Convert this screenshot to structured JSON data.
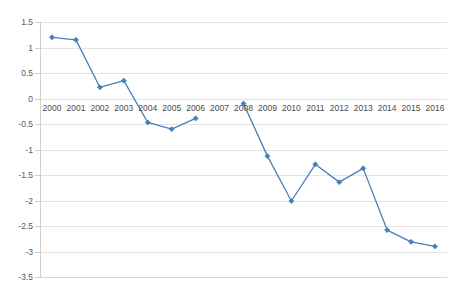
{
  "chart_data": {
    "type": "line",
    "title": "",
    "subtitle": "",
    "xlabel": "",
    "ylabel": "",
    "categories": [
      "2000",
      "2001",
      "2002",
      "2003",
      "2004",
      "2005",
      "2006",
      "2007",
      "2008",
      "2009",
      "2010",
      "2011",
      "2012",
      "2013",
      "2014",
      "2015",
      "2016"
    ],
    "series": [
      {
        "name": "Series 1",
        "color": "#4a7ebb",
        "values": [
          1.2,
          1.15,
          0.22,
          0.35,
          -0.47,
          -0.6,
          -0.39,
          null,
          -0.1,
          -1.13,
          -2.01,
          -1.29,
          -1.64,
          -1.37,
          -2.58,
          -2.81,
          -2.9
        ]
      }
    ],
    "ylim": [
      -3.5,
      1.5
    ],
    "y_ticks": [
      "1.5",
      "1",
      "0.5",
      "0",
      "-0.5",
      "-1",
      "-1.5",
      "-2",
      "-2.5",
      "-3",
      "-3.5"
    ],
    "y_tick_values": [
      1.5,
      1,
      0.5,
      0,
      -0.5,
      -1,
      -1.5,
      -2,
      -2.5,
      -3,
      -3.5
    ],
    "x_tick_labels": [
      "2000",
      "2001",
      "2002",
      "2003",
      "2004",
      "2005",
      "2006",
      "2007",
      "2008",
      "2009",
      "2010",
      "2011",
      "2012",
      "2013",
      "2014",
      "2015",
      "2016"
    ],
    "x_axis_label_position_value": 0,
    "grid": true,
    "grid_axis": "y",
    "legend": false,
    "legend_position": "none",
    "markers": true,
    "marker_shape": "diamond",
    "line_color": "#4a7ebb",
    "grid_color": "#e4e4e4",
    "background_color": "#ffffff",
    "text_color": "#4a4a4a"
  }
}
